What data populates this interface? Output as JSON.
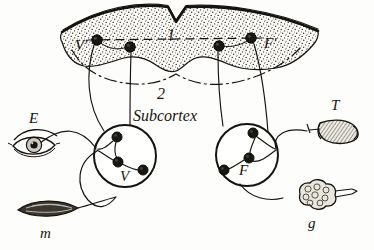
{
  "figure": {
    "background_color": "#fdfdfb",
    "ink_color": "#15130f",
    "width": 374,
    "height": 250
  },
  "labels": {
    "cortex_layer_number": "1",
    "subcortex_layer_number": "2",
    "subcortex_name": "Subcortex",
    "cortical_visual_center": "V'",
    "cortical_motor_center": "F'",
    "subcortical_visual_center": "V",
    "subcortical_motor_center": "F",
    "eye": "E",
    "muscle": "m",
    "tongue_organ": "T",
    "gland": "g"
  },
  "parts": [
    {
      "id": "cortex",
      "label": "1",
      "name": "Cortex band",
      "kind": "stippled-band"
    },
    {
      "id": "subcortex",
      "label": "2",
      "name": "Subcortex",
      "kind": "region"
    },
    {
      "id": "v-prime",
      "label": "V'",
      "name": "Cortical visual center",
      "kind": "cortical-node-group"
    },
    {
      "id": "f-prime",
      "label": "F'",
      "name": "Cortical motor center",
      "kind": "cortical-node-group"
    },
    {
      "id": "v-node",
      "label": "V",
      "name": "Subcortical visual nucleus",
      "kind": "nucleus"
    },
    {
      "id": "f-node",
      "label": "F",
      "name": "Subcortical motor nucleus",
      "kind": "nucleus"
    },
    {
      "id": "eye",
      "label": "E",
      "name": "Eye (receptor)",
      "kind": "organ"
    },
    {
      "id": "muscle",
      "label": "m",
      "name": "Muscle (effector)",
      "kind": "organ"
    },
    {
      "id": "organ-t",
      "label": "T",
      "name": "Effector organ T",
      "kind": "organ"
    },
    {
      "id": "gland",
      "label": "g",
      "name": "Gland",
      "kind": "organ"
    }
  ],
  "cortical_nodes": [
    {
      "id": "cn1",
      "cx": 97,
      "cy": 40,
      "r": 5.2
    },
    {
      "id": "cn2",
      "cx": 130,
      "cy": 47,
      "r": 5.2
    },
    {
      "id": "cn3",
      "cx": 219,
      "cy": 46,
      "r": 5.2
    },
    {
      "id": "cn4",
      "cx": 251,
      "cy": 38,
      "r": 5.2
    }
  ],
  "subcortical_nuclei": [
    {
      "id": "left-nucleus",
      "label": "V",
      "cx": 125,
      "cy": 156,
      "r": 31
    },
    {
      "id": "right-nucleus",
      "label": "F",
      "cx": 247,
      "cy": 155,
      "r": 31
    }
  ],
  "left_nucleus_cells": [
    {
      "id": "lc1",
      "cx": 117,
      "cy": 137,
      "r": 5.0
    },
    {
      "id": "lc2",
      "cx": 118,
      "cy": 162,
      "r": 5.0
    },
    {
      "id": "lc3",
      "cx": 143,
      "cy": 170,
      "r": 5.0
    }
  ],
  "right_nucleus_cells": [
    {
      "id": "rc1",
      "cx": 253,
      "cy": 133,
      "r": 5.0
    },
    {
      "id": "rc2",
      "cx": 249,
      "cy": 158,
      "r": 5.0
    },
    {
      "id": "rc3",
      "cx": 224,
      "cy": 170,
      "r": 5.0
    }
  ]
}
